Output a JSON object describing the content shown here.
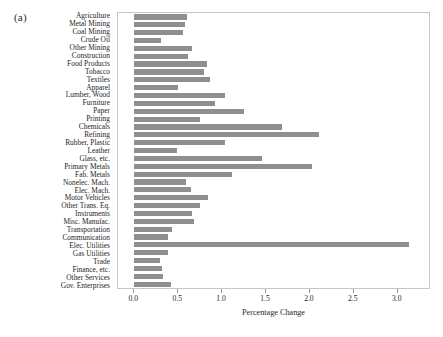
{
  "figure": {
    "panel_label": "(a)",
    "bar_color": "#8f8f8f",
    "frame_color": "#c8c6c2"
  },
  "chart_data": {
    "type": "bar",
    "orientation": "horizontal",
    "title": "",
    "xlabel": "Percentage Change",
    "ylabel": "",
    "xlim": [
      0.0,
      3.56
    ],
    "xticks": [
      0.0,
      0.5,
      1.0,
      1.5,
      2.0,
      2.5,
      3.0
    ],
    "xtick_labels": [
      "0.0",
      "0.5",
      "1.0",
      "1.5",
      "2.0",
      "2.5",
      "3.0"
    ],
    "grid": false,
    "legend": null,
    "categories": [
      "Agriculture",
      "Metal Mining",
      "Coal Mining",
      "Crude Oil",
      "Other Mining",
      "Construction",
      "Food Products",
      "Tobacco",
      "Textiles",
      "Apparel",
      "Lumber, Wood",
      "Furniture",
      "Paper",
      "Printing",
      "Chemicals",
      "Refining",
      "Rubber, Plastic",
      "Leather",
      "Glass, etc.",
      "Primary Metals",
      "Fab. Metals",
      "Nonelec. Mach.",
      "Elec. Mach.",
      "Motor Vehicles",
      "Other Trans. Eq.",
      "Instruments",
      "Misc. Manufac.",
      "Transportation",
      "Communication",
      "Elec. Utilities",
      "Gas Utilities",
      "Trade",
      "Finance, etc.",
      "Other Services",
      "Gov. Enterprises"
    ],
    "values": [
      0.6,
      0.58,
      0.56,
      0.3,
      0.66,
      0.61,
      0.83,
      0.79,
      0.86,
      0.5,
      1.03,
      0.92,
      1.25,
      0.75,
      1.68,
      2.1,
      1.03,
      0.49,
      1.45,
      2.02,
      1.11,
      0.59,
      0.65,
      0.84,
      0.75,
      0.66,
      0.68,
      0.43,
      0.38,
      3.13,
      0.38,
      0.29,
      0.31,
      0.33,
      0.42
    ]
  }
}
